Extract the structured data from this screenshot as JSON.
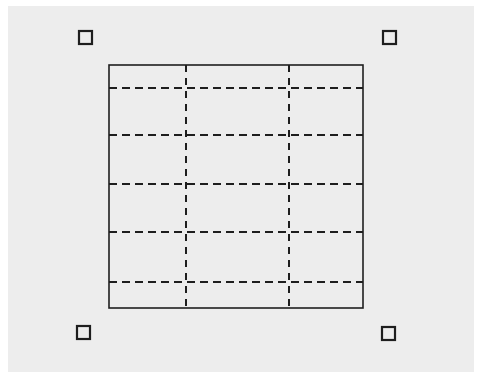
{
  "diagram": {
    "type": "selected-grid-frame",
    "background_color": "#ededed",
    "stroke_color": "#1e1e1e",
    "frame": {
      "x": 109,
      "y": 65,
      "width": 254,
      "height": 243
    },
    "handles": [
      {
        "name": "top-left",
        "x": 78,
        "y": 30,
        "size": 15
      },
      {
        "name": "top-right",
        "x": 382,
        "y": 30,
        "size": 15
      },
      {
        "name": "bottom-left",
        "x": 76,
        "y": 325,
        "size": 15
      },
      {
        "name": "bottom-right",
        "x": 381,
        "y": 326,
        "size": 15
      }
    ],
    "horizontal_guides_y": [
      88,
      135,
      184,
      232,
      282
    ],
    "vertical_guides_x": [
      186,
      289
    ],
    "guide_style": "dashed"
  }
}
